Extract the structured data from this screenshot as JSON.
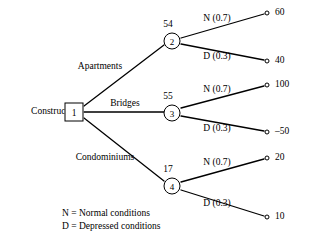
{
  "diagram": {
    "type": "decision-tree",
    "root": {
      "label": "Construct",
      "node_id": "1",
      "shape": "square"
    },
    "branches": [
      {
        "label": "Apartments",
        "node_id": "2",
        "expected_value": "54",
        "outcomes": [
          {
            "label": "N (0.7)",
            "payoff": "60"
          },
          {
            "label": "D (0.3)",
            "payoff": "40"
          }
        ]
      },
      {
        "label": "Bridges",
        "node_id": "3",
        "expected_value": "55",
        "outcomes": [
          {
            "label": "N (0.7)",
            "payoff": "100"
          },
          {
            "label": "D (0.3)",
            "payoff": "–50"
          }
        ]
      },
      {
        "label": "Condominiums",
        "node_id": "4",
        "expected_value": "17",
        "outcomes": [
          {
            "label": "N (0.7)",
            "payoff": "20"
          },
          {
            "label": "D (0.3)",
            "payoff": "10"
          }
        ]
      }
    ],
    "legend": [
      "N = Normal conditions",
      "D = Depressed conditions"
    ]
  }
}
